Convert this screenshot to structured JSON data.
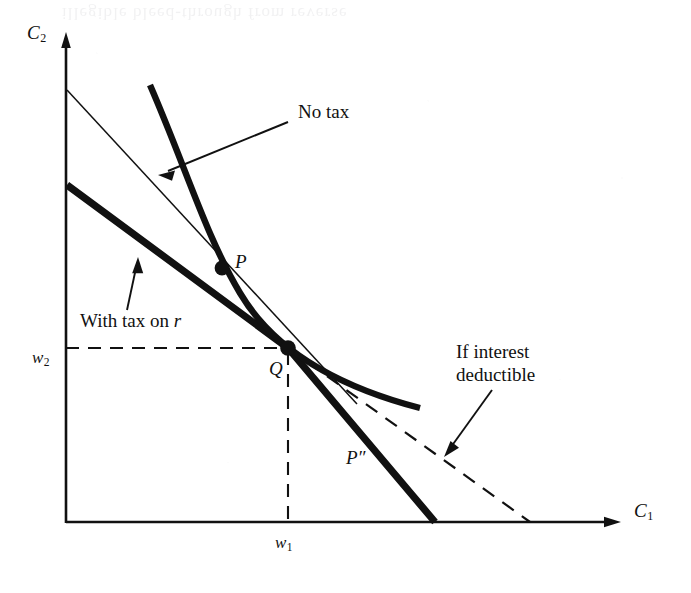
{
  "figure": {
    "type": "economics-diagram"
  },
  "axes": {
    "y_label": "C",
    "y_label_sub": "2",
    "x_label": "C",
    "x_label_sub": "1",
    "origin": [
      66,
      523
    ],
    "y_top": [
      66,
      35
    ],
    "x_right": [
      620,
      522
    ]
  },
  "ticks": {
    "w1_label": "w",
    "w1_sub": "1",
    "w2_label": "w",
    "w2_sub": "2",
    "endowment_point": [
      288,
      348
    ]
  },
  "points": [
    {
      "label": "P",
      "x": 222,
      "y": 268
    },
    {
      "label": "Q",
      "x": 288,
      "y": 348
    },
    {
      "label": "P″",
      "x": 352,
      "y": 460
    }
  ],
  "annotations": [
    {
      "name": "no-tax",
      "text": "No tax",
      "x": 298,
      "y": 113
    },
    {
      "name": "with-tax-on-r",
      "text_prefix": "With tax on ",
      "text_italic": "r",
      "x": 80,
      "y": 322
    },
    {
      "name": "if-interest-deductible-line1",
      "text": "If interest",
      "x": 456,
      "y": 352
    },
    {
      "name": "if-interest-deductible-line2",
      "text": "deductible",
      "x": 456,
      "y": 375
    }
  ],
  "curves": {
    "no_tax_budget_line": {
      "name": "no-tax-budget-line",
      "style": "thin-solid",
      "from": [
        67,
        90
      ],
      "to": [
        357,
        404
      ]
    },
    "with_tax_budget_line": {
      "name": "with-tax-budget-line",
      "style": "thick-solid",
      "from": [
        67,
        185
      ],
      "kink": [
        288,
        348
      ],
      "to": [
        435,
        522
      ]
    },
    "indifference_curve": {
      "name": "indifference-curve",
      "style": "thick-solid-convex",
      "from": [
        150,
        85
      ],
      "through": [
        288,
        348
      ],
      "to": [
        420,
        408
      ]
    },
    "deductible_line": {
      "name": "interest-deductible-line",
      "style": "dashed",
      "from": [
        288,
        348
      ],
      "to": [
        530,
        522
      ]
    },
    "endowment_guides": {
      "name": "endowment-guide-lines",
      "style": "dashed",
      "horizontal_from": [
        66,
        348
      ],
      "horizontal_to": [
        288,
        348
      ],
      "vertical_from": [
        288,
        348
      ],
      "vertical_to": [
        288,
        522
      ]
    }
  },
  "colors": {
    "ink": "#111111",
    "paper": "#ffffff"
  },
  "ghost_text": "illegible bleed-through from reverse page"
}
